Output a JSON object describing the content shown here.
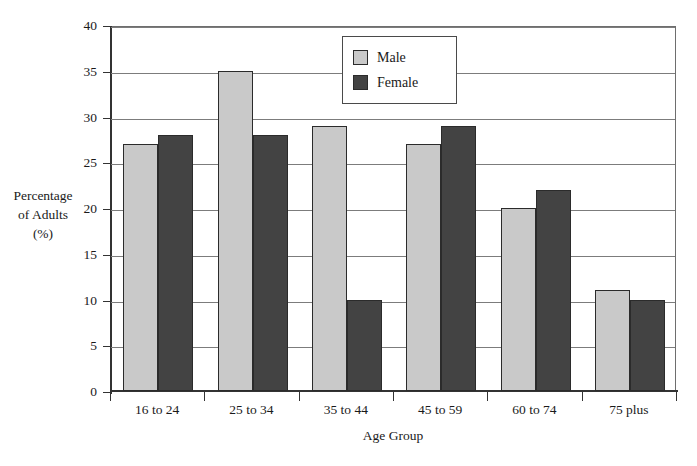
{
  "chart_data": {
    "type": "bar",
    "title": "",
    "xlabel": "Age Group",
    "ylabel": "Percentage of Adults (%)",
    "ylim": [
      0,
      40
    ],
    "yticks": [
      0,
      5,
      10,
      15,
      20,
      25,
      30,
      35,
      40
    ],
    "grid": true,
    "legend_position": "top-center",
    "categories": [
      "16 to 24",
      "25 to 34",
      "35 to 44",
      "45 to 59",
      "60 to 74",
      "75 plus"
    ],
    "series": [
      {
        "name": "Male",
        "color": "#c9c9c9",
        "values": [
          27,
          35,
          29,
          27,
          20,
          11
        ]
      },
      {
        "name": "Female",
        "color": "#434343",
        "values": [
          28,
          28,
          10,
          29,
          22,
          10
        ]
      }
    ]
  },
  "axes": {
    "y_title_lines": [
      "Percentage",
      "of Adults",
      "(%)"
    ],
    "y_tick_labels": [
      "40",
      "35",
      "30",
      "25",
      "20",
      "15",
      "10",
      "5",
      "0"
    ],
    "x_title": "Age Group",
    "x_tick_labels": [
      "16 to 24",
      "25 to 34",
      "35 to 44",
      "45 to 59",
      "60 to 74",
      "75 plus"
    ]
  },
  "legend": {
    "entries": [
      {
        "label": "Male",
        "color": "#c9c9c9"
      },
      {
        "label": "Female",
        "color": "#434343"
      }
    ]
  },
  "header": {
    "cropped_title": ""
  }
}
